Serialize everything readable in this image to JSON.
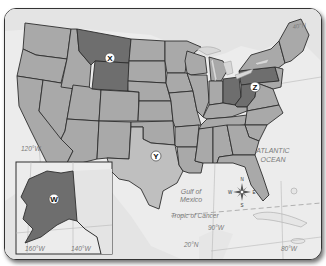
{
  "map": {
    "title": "",
    "colors": {
      "water": "#ececec",
      "land_other": "#e2e2e2",
      "state_default": "#a9a9a9",
      "state_highlight_dark": "#6e6e6e",
      "state_highlight_light": "#bfbfbf",
      "border": "#2e2e2e"
    },
    "markers": [
      {
        "id": "X",
        "label": "X",
        "region": "Montana / Wyoming"
      },
      {
        "id": "Y",
        "label": "Y",
        "region": "Texas"
      },
      {
        "id": "Z",
        "label": "Z",
        "region": "Ohio / Pennsylvania / West Virginia"
      },
      {
        "id": "W",
        "label": "W",
        "region": "Alaska"
      }
    ],
    "water_labels": {
      "atlantic_line1": "ATLANTIC",
      "atlantic_line2": "OCEAN",
      "gulf_line1": "Gulf of",
      "gulf_line2": "Mexico"
    },
    "lines": {
      "tropic": "Tropic of Cancer",
      "lat_20": "20°N",
      "lat_40": "40°N"
    },
    "longitudes": {
      "lon_120": "120°W",
      "lon_90": "90°W",
      "lon_80": "80°W",
      "lon_160": "160°W",
      "lon_140": "140°W"
    },
    "compass": {
      "n": "N",
      "s": "S",
      "e": "E",
      "w": "W"
    }
  }
}
